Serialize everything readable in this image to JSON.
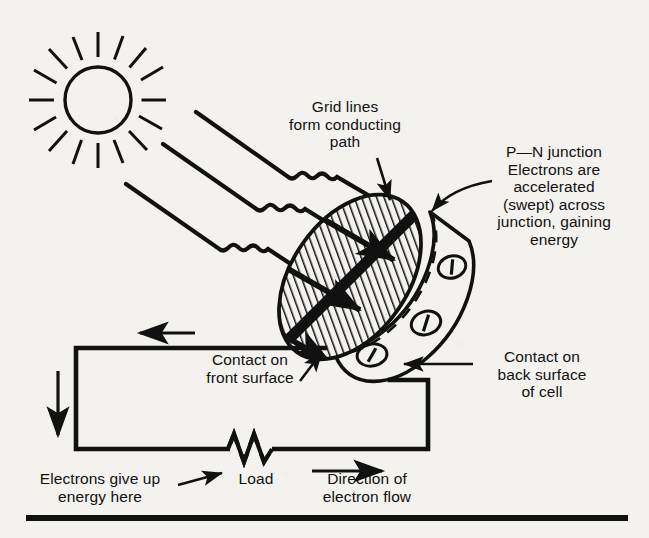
{
  "figure": {
    "background_color": "#f3f2ef",
    "ink_color": "#111111"
  },
  "labels": {
    "grid_lines": "Grid lines\nform conducting\npath",
    "pn_junction": "P—N junction\nElectrons are\naccelerated\n(swept) across\njunction, gaining\nenergy",
    "contact_front": "Contact on\nfront surface",
    "contact_back": "Contact on\nback surface\nof cell",
    "electrons_give_up": "Electrons give up\nenergy here",
    "load": "Load",
    "direction_flow": "Direction of\nelectron flow"
  },
  "components": {
    "sun": {
      "name": "sun",
      "rays": 16,
      "cx": 98,
      "cy": 100,
      "r": 33
    },
    "light_rays": {
      "name": "light-rays",
      "count": 3,
      "style": "straight-wavy-straight",
      "angle_deg": 35
    },
    "cell": {
      "name": "solar-cell",
      "shape": "tilted-disc",
      "rotation_deg": -55,
      "hatching": "diagonal",
      "junction_band": "thick dark diagonal stripe",
      "grid_lines": 3,
      "back_contacts": 3
    },
    "circuit": {
      "name": "external-circuit",
      "load_symbol": "resistor-zigzag",
      "current_arrows": [
        "left-top",
        "down-left",
        "right-bottom"
      ]
    },
    "rule": {
      "name": "bottom-rule"
    }
  }
}
